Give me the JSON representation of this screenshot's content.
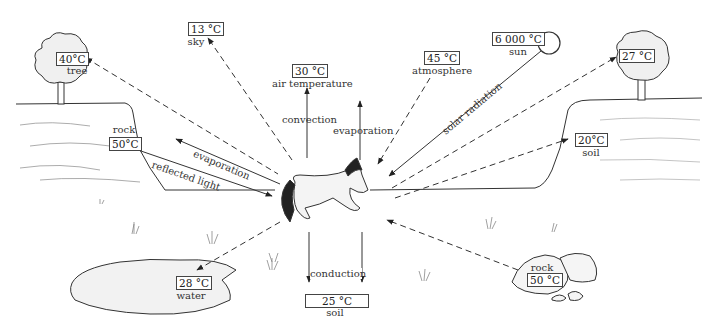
{
  "sources": {
    "tree_left": {
      "temp": "40°C",
      "label": "tree"
    },
    "sky": {
      "temp": "13 °C",
      "label": "sky"
    },
    "air": {
      "temp": "30 °C",
      "label": "air temperature"
    },
    "atmosphere": {
      "temp": "45 °C",
      "label": "atmosphere"
    },
    "sun": {
      "temp": "6 000 °C",
      "label": "sun"
    },
    "tree_right": {
      "temp": "27 °C"
    },
    "rock_left": {
      "temp": "50°C",
      "label": "rock"
    },
    "soil_right": {
      "temp": "20°C",
      "label": "soil"
    },
    "water": {
      "temp": "28 °C",
      "label": "water"
    },
    "soil_below": {
      "temp": "25 °C",
      "label": "soil"
    },
    "rock_right": {
      "temp": "50 °C",
      "label": "rock"
    }
  },
  "processes": {
    "convection": "convection",
    "evaporation_up": "evaporation",
    "evaporation_left": "evaporation",
    "reflected_light": "reflected light",
    "solar_radiation": "solar radiation",
    "conduction": "conduction"
  },
  "colors": {
    "line": "#333333",
    "fill": "#f2f2f2",
    "background": "#ffffff"
  }
}
